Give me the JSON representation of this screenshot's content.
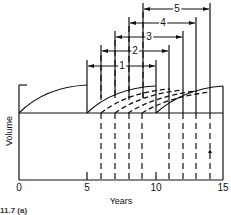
{
  "figure": {
    "x_axis": {
      "title": "Years",
      "ticks": [
        {
          "label": "0",
          "value": 0
        },
        {
          "label": "5",
          "value": 5
        },
        {
          "label": "10",
          "value": 10
        },
        {
          "label": "15",
          "value": 15
        }
      ]
    },
    "y_axis": {
      "title": "Volume"
    },
    "intervals": [
      {
        "label": "1",
        "start": 5,
        "end": 10
      },
      {
        "label": "2",
        "start": 6,
        "end": 11
      },
      {
        "label": "3",
        "start": 7,
        "end": 12
      },
      {
        "label": "4",
        "start": 8,
        "end": 13
      },
      {
        "label": "5",
        "start": 9,
        "end": 14
      }
    ],
    "dashed_lines_years": [
      6,
      7,
      8,
      9,
      11,
      12,
      13,
      14
    ],
    "solid_lines_years": [
      5,
      10
    ],
    "caption": "11.7 (a)"
  }
}
